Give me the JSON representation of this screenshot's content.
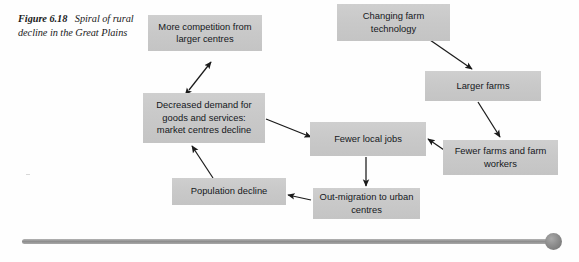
{
  "figure": {
    "caption_lead": "Figure 6.18",
    "caption_text": "Spiral of rural decline in the Great Plains",
    "caption_full": "Figure 6.18  Spiral of rural decline in the Great Plains"
  },
  "colors": {
    "background": "#fefefe",
    "node_fill": "#c9c9c9",
    "node_text": "#15181c",
    "arrow": "#1b1b1b",
    "scrollbar_track": "#8e8e8e",
    "scrollbar_thumb": "#7a7a7a"
  },
  "diagram": {
    "type": "flowchart",
    "title": "Spiral of rural decline in the Great Plains",
    "nodes": [
      {
        "id": "more-competition",
        "label": "More competition from larger centres"
      },
      {
        "id": "changing-farm-tech",
        "label": "Changing farm technology"
      },
      {
        "id": "larger-farms",
        "label": "Larger farms"
      },
      {
        "id": "decreased-demand",
        "label": "Decreased demand for goods and services: market centres decline"
      },
      {
        "id": "fewer-local-jobs",
        "label": "Fewer local jobs"
      },
      {
        "id": "fewer-farms",
        "label": "Fewer farms and farm workers"
      },
      {
        "id": "population-decline",
        "label": "Population decline"
      },
      {
        "id": "out-migration",
        "label": "Out-migration to urban centres"
      }
    ],
    "edges": [
      {
        "from": "more-competition",
        "to": "decreased-demand",
        "style": "double-headed"
      },
      {
        "from": "changing-farm-tech",
        "to": "larger-farms",
        "style": "single"
      },
      {
        "from": "larger-farms",
        "to": "fewer-farms",
        "style": "single"
      },
      {
        "from": "fewer-farms",
        "to": "fewer-local-jobs",
        "style": "single"
      },
      {
        "from": "decreased-demand",
        "to": "fewer-local-jobs",
        "style": "single"
      },
      {
        "from": "fewer-local-jobs",
        "to": "out-migration",
        "style": "single"
      },
      {
        "from": "out-migration",
        "to": "population-decline",
        "style": "single"
      },
      {
        "from": "population-decline",
        "to": "decreased-demand",
        "style": "single"
      }
    ]
  },
  "scrollbar": {
    "orientation": "horizontal",
    "thumb_position": "right"
  }
}
